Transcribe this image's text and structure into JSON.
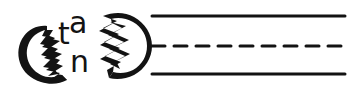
{
  "canvas": {
    "width": 355,
    "height": 94,
    "background_color": "#ffffff",
    "ink_color": "#131313",
    "description": "hand-drawn black-ink sketch on white background"
  },
  "glyphs": {
    "letter_t": {
      "char": "t",
      "x": 58,
      "y": 44,
      "size": 30
    },
    "letter_a": {
      "char": "a",
      "x": 69,
      "y": 33,
      "size": 30
    },
    "letter_n": {
      "char": "n",
      "x": 70,
      "y": 72,
      "size": 30
    }
  },
  "shapes": {
    "left_cracked_disc": {
      "name": "left-cracked-disc",
      "label": "crescent disc with jagged zigzag crack on right side",
      "center_x": 46,
      "center_y": 55,
      "radius": 30
    },
    "right_cracked_disc": {
      "name": "right-cracked-disc",
      "label": "crescent disc with jagged zigzag crack on left side",
      "center_x": 121,
      "center_y": 45,
      "radius": 32
    }
  },
  "lines": {
    "x_start": 152,
    "x_end": 345,
    "stroke_width": 3,
    "items": [
      {
        "name": "top-line",
        "style": "solid",
        "y": 16,
        "dash_pattern": ""
      },
      {
        "name": "middle-line",
        "style": "dashed",
        "y": 46,
        "dash_pattern": "13 9"
      },
      {
        "name": "bottom-line",
        "style": "solid",
        "y": 74,
        "dash_pattern": ""
      }
    ]
  }
}
